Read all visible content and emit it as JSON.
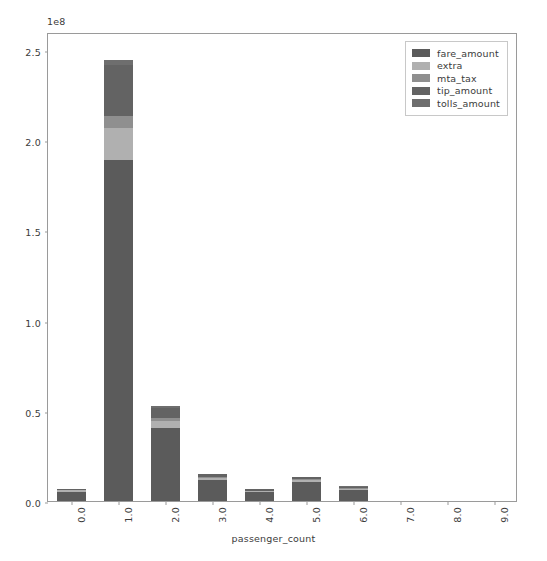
{
  "chart_data": {
    "type": "bar",
    "subtype": "stacked-bar",
    "title": "",
    "xlabel": "passenger_count",
    "ylabel": "",
    "y_offset_text": "1e8",
    "y_offset_multiplier": 100000000,
    "categories": [
      "0.0",
      "1.0",
      "2.0",
      "3.0",
      "4.0",
      "5.0",
      "6.0",
      "7.0",
      "8.0",
      "9.0"
    ],
    "xlim": [
      -0.5,
      9.5
    ],
    "ylim": [
      0,
      260000000
    ],
    "yticks": [
      0,
      50000000,
      100000000,
      150000000,
      200000000,
      250000000
    ],
    "ytick_labels": [
      "0.0",
      "0.5",
      "1.0",
      "1.5",
      "2.0",
      "2.5"
    ],
    "grid": false,
    "legend_position": "upper right",
    "series": [
      {
        "name": "fare_amount",
        "color": "#5b5b5b",
        "values": [
          5200000,
          189000000,
          40500000,
          11600000,
          5000000,
          10500000,
          6200000,
          0,
          0,
          0
        ]
      },
      {
        "name": "extra",
        "color": "#b0b0b0",
        "values": [
          700000,
          18000000,
          4100000,
          1300000,
          600000,
          1100000,
          700000,
          0,
          0,
          0
        ]
      },
      {
        "name": "mta_tax",
        "color": "#8f8f8f",
        "values": [
          200000,
          6500000,
          1500000,
          450000,
          200000,
          400000,
          250000,
          0,
          0,
          0
        ]
      },
      {
        "name": "tip_amount",
        "color": "#636363",
        "values": [
          600000,
          28000000,
          5600000,
          1600000,
          650000,
          1300000,
          800000,
          0,
          0,
          0
        ]
      },
      {
        "name": "tolls_amount",
        "color": "#6e6e6e",
        "values": [
          150000,
          3000000,
          800000,
          250000,
          100000,
          200000,
          130000,
          0,
          0,
          0
        ]
      }
    ],
    "totals": [
      6850000,
      244500000,
      52500000,
      15200000,
      6550000,
      13500000,
      8080000,
      0,
      0,
      0
    ]
  },
  "legend": {
    "items": [
      {
        "label": "fare_amount"
      },
      {
        "label": "extra"
      },
      {
        "label": "mta_tax"
      },
      {
        "label": "tip_amount"
      },
      {
        "label": "tolls_amount"
      }
    ]
  }
}
